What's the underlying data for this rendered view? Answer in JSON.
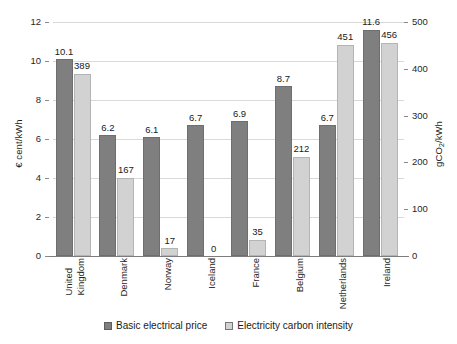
{
  "chart_data": {
    "type": "bar",
    "title": "",
    "xlabel": "",
    "categories": [
      "United Kingdom",
      "Denmark",
      "Norway",
      "Iceland",
      "France",
      "Belgium",
      "Netherlands",
      "Ireland"
    ],
    "category_lines": [
      [
        "United",
        "Kingdom"
      ],
      [
        "Denmark"
      ],
      [
        "Norway"
      ],
      [
        "Iceland"
      ],
      [
        "France"
      ],
      [
        "Belgium"
      ],
      [
        "Netherlands"
      ],
      [
        "Ireland"
      ]
    ],
    "series": [
      {
        "name": "Basic electrical price",
        "axis": "left",
        "unit": "€ cent/kWh",
        "color": "#7f7f7f",
        "values": [
          10.1,
          6.2,
          6.1,
          6.7,
          6.9,
          8.7,
          6.7,
          11.6
        ],
        "labels": [
          "10.1",
          "6.2",
          "6.1",
          "6.7",
          "6.9",
          "8.7",
          "6.7",
          "11.6"
        ]
      },
      {
        "name": "Electricity carbon intensity",
        "axis": "right",
        "unit": "gCO2/kWh",
        "color": "#d2d2d2",
        "values": [
          389,
          167,
          17,
          0,
          35,
          212,
          451,
          456
        ],
        "labels": [
          "389",
          "167",
          "17",
          "0",
          "35",
          "212",
          "451",
          "456"
        ]
      }
    ],
    "ylabel": "€ cent/kWh",
    "ylabel_right_prefix": "gCO",
    "ylabel_right_sub": "2",
    "ylabel_right_suffix": "/kWh",
    "ylim": [
      0,
      12
    ],
    "ylim_right": [
      0,
      500
    ],
    "yticks_left": [
      "0",
      "2",
      "4",
      "6",
      "8",
      "10",
      "12"
    ],
    "yticks_left_values": [
      0,
      2,
      4,
      6,
      8,
      10,
      12
    ],
    "yticks_right": [
      "0",
      "100",
      "200",
      "300",
      "400",
      "500"
    ],
    "yticks_right_values": [
      0,
      100,
      200,
      300,
      400,
      500
    ],
    "grid": true,
    "legend_position": "bottom"
  },
  "legend": {
    "items": [
      {
        "label": "Basic electrical price",
        "swatch": "swatch-price"
      },
      {
        "label": "Electricity carbon intensity",
        "swatch": "swatch-carbon"
      }
    ]
  }
}
